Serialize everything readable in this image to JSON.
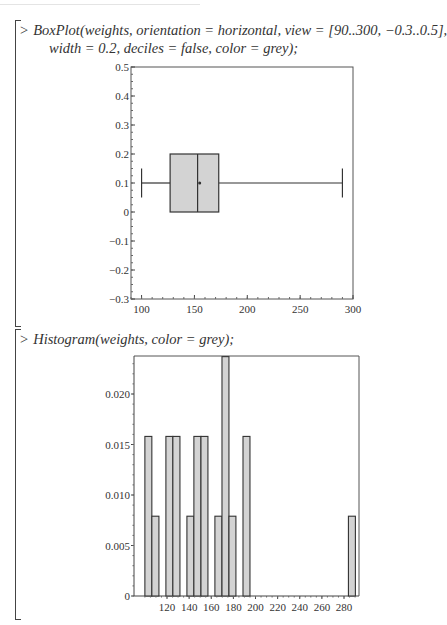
{
  "worksheet": {
    "prompt_symbol": ">",
    "commands": [
      {
        "line1": "BoxPlot(weights, orientation = horizontal, view = [90..300, −0.3..0.5],",
        "line2": "width = 0.2, deciles = false, color = grey);"
      },
      {
        "line1": "Histogram(weights, color = grey);"
      }
    ]
  },
  "chart_data": [
    {
      "type": "boxplot",
      "title": "",
      "orientation": "horizontal",
      "xlabel": "",
      "ylabel": "",
      "xlim": [
        90,
        300
      ],
      "ylim": [
        -0.3,
        0.5
      ],
      "x_tick_labels": [
        "100",
        "150",
        "200",
        "250",
        "300"
      ],
      "y_tick_labels": [
        "-0.3",
        "-0.2",
        "-0.1",
        "0",
        "0.1",
        "0.2",
        "0.3",
        "0.4",
        "0.5"
      ],
      "box": {
        "min": 100,
        "q1": 127,
        "median": 153,
        "mean": 155,
        "q3": 173,
        "max": 290,
        "y_center": 0.1,
        "width": 0.2
      },
      "fill_color": "#d3d3d3",
      "grid": false
    },
    {
      "type": "bar",
      "subtype": "histogram",
      "title": "",
      "xlabel": "",
      "ylabel": "",
      "xlim": [
        100,
        291
      ],
      "ylim": [
        0,
        0.0238
      ],
      "x_tick_labels": [
        "120",
        "140",
        "160",
        "180",
        "200",
        "220",
        "240",
        "260",
        "280"
      ],
      "y_tick_labels": [
        "0",
        "0.005",
        "0.010",
        "0.015",
        "0.020"
      ],
      "bins": [
        {
          "x0": 100,
          "x1": 106.3,
          "density": 0.0158
        },
        {
          "x0": 106.3,
          "x1": 112.7,
          "density": 0.0079
        },
        {
          "x0": 119.0,
          "x1": 125.3,
          "density": 0.0158
        },
        {
          "x0": 125.3,
          "x1": 131.7,
          "density": 0.0158
        },
        {
          "x0": 138.0,
          "x1": 144.3,
          "density": 0.0079
        },
        {
          "x0": 144.3,
          "x1": 150.7,
          "density": 0.0158
        },
        {
          "x0": 150.7,
          "x1": 157.0,
          "density": 0.0158
        },
        {
          "x0": 163.3,
          "x1": 169.7,
          "density": 0.0079
        },
        {
          "x0": 169.7,
          "x1": 176.0,
          "density": 0.0237
        },
        {
          "x0": 176.0,
          "x1": 182.3,
          "density": 0.0079
        },
        {
          "x0": 188.7,
          "x1": 195.0,
          "density": 0.0158
        },
        {
          "x0": 284.0,
          "x1": 290.3,
          "density": 0.0079
        }
      ],
      "fill_color": "#d3d3d3",
      "grid": false
    }
  ]
}
